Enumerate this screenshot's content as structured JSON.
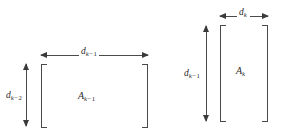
{
  "figure": {
    "type": "matrix-dimension-diagram",
    "background_color": "#ffffff",
    "line_color": "#4a4a4a",
    "text_color": "#2b2b2b",
    "blocks": [
      {
        "id": "left-block",
        "matrix_label": {
          "base": "A",
          "sub_var": "k",
          "sub_op": "−",
          "sub_num": "1"
        },
        "width_label": {
          "base": "d",
          "sub_var": "k",
          "sub_op": "−",
          "sub_num": "1"
        },
        "height_label": {
          "base": "d",
          "sub_var": "k",
          "sub_op": "−",
          "sub_num": "2"
        },
        "orientation": "wide",
        "width_arrow_position": "top",
        "height_arrow_position": "left"
      },
      {
        "id": "right-block",
        "matrix_label": {
          "base": "A",
          "sub_var": "k",
          "sub_op": "",
          "sub_num": ""
        },
        "width_label": {
          "base": "d",
          "sub_var": "k",
          "sub_op": "",
          "sub_num": ""
        },
        "height_label": {
          "base": "d",
          "sub_var": "k",
          "sub_op": "−",
          "sub_num": "1"
        },
        "orientation": "tall",
        "width_arrow_position": "top",
        "height_arrow_position": "left"
      }
    ]
  }
}
